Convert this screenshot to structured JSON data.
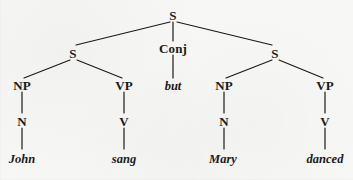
{
  "diagram": {
    "type": "constituency-tree",
    "ink_color": "#1a1a1a",
    "background_color": "#f7f7f6",
    "sentence": "John sang but Mary danced",
    "nodes": {
      "root_s": "S",
      "left_s": "S",
      "conj": "Conj",
      "right_s": "S",
      "left_np": "NP",
      "left_vp": "VP",
      "right_np": "NP",
      "right_vp": "VP",
      "left_n": "N",
      "left_v": "V",
      "right_n": "N",
      "right_v": "V"
    },
    "leaves": {
      "john": "John",
      "sang": "sang",
      "but": "but",
      "mary": "Mary",
      "danced": "danced"
    }
  }
}
